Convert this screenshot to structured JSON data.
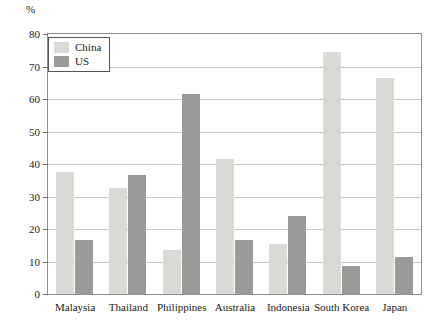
{
  "chart_data": {
    "type": "bar",
    "title": "",
    "xlabel": "",
    "ylabel": "%",
    "ylim": [
      0,
      80
    ],
    "yticks": [
      0,
      10,
      20,
      30,
      40,
      50,
      60,
      70,
      80
    ],
    "grid": true,
    "legend_position": "top-left",
    "categories": [
      "Malaysia",
      "Thailand",
      "Philippines",
      "Australia",
      "Indonesia",
      "South Korea",
      "Japan"
    ],
    "series": [
      {
        "name": "China",
        "color": "#d9d9d5",
        "values": [
          37.5,
          32.5,
          13.5,
          41.5,
          15.5,
          74.5,
          66.5
        ]
      },
      {
        "name": "US",
        "color": "#9a9a98",
        "values": [
          16.5,
          36.5,
          61.5,
          16.5,
          24.0,
          8.5,
          11.5
        ]
      }
    ]
  },
  "axis": {
    "unit_label": "%"
  },
  "colors": {
    "china": "#d9d9d5",
    "us": "#9a9a98",
    "grid": "#c9c9c9",
    "frame": "#8d8d8d",
    "text": "#1a1a1a"
  }
}
